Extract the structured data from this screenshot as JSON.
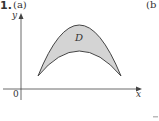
{
  "figure": {
    "problem_number": "1.",
    "part_a_label": "(a)",
    "part_b_label": "(b",
    "axes": {
      "x_label": "x",
      "y_label": "y",
      "origin_label": "0"
    },
    "region": {
      "label": "D",
      "fill_color": "#d4d4d4",
      "stroke_color": "#444444",
      "description": "Region between two downward-opening arch curves meeting at endpoints"
    }
  }
}
